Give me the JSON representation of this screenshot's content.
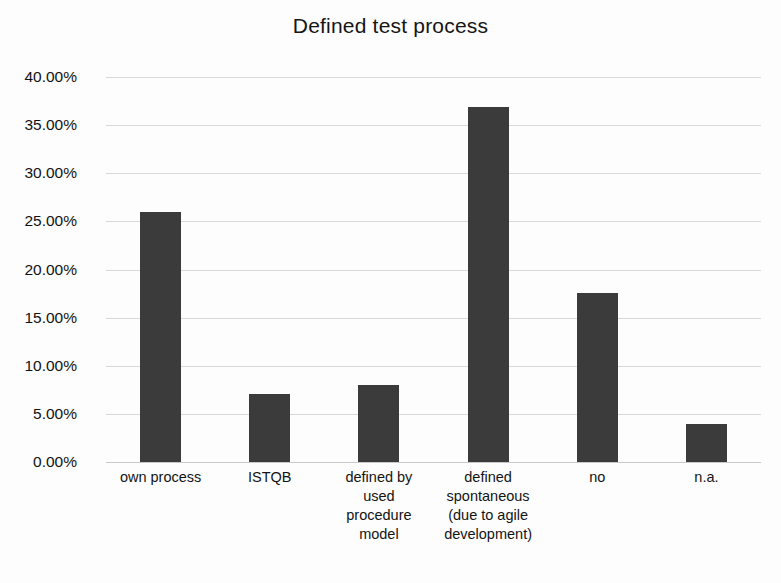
{
  "chart_data": {
    "type": "bar",
    "title": "Defined test process",
    "xlabel": "",
    "ylabel": "",
    "grid": true,
    "legend": "none",
    "ylim": [
      0,
      40
    ],
    "ytick_step": 5,
    "categories": [
      "own process",
      "ISTQB",
      "defined by used procedure model",
      "defined spontaneous (due to agile development)",
      "no",
      "n.a."
    ],
    "category_lines": [
      [
        "own process"
      ],
      [
        "ISTQB"
      ],
      [
        "defined by",
        "used",
        "procedure",
        "model"
      ],
      [
        "defined",
        "spontaneous",
        "(due to agile",
        "development)"
      ],
      [
        "no"
      ],
      [
        "n.a."
      ]
    ],
    "values": [
      26.0,
      7.1,
      8.0,
      36.9,
      17.6,
      3.9
    ],
    "value_labels": [
      "26.00%",
      "7.10%",
      "8.00%",
      "36.90%",
      "17.60%",
      "3.90%"
    ],
    "ytick_labels": [
      "40.00%",
      "35.00%",
      "30.00%",
      "25.00%",
      "20.00%",
      "15.00%",
      "10.00%",
      "5.00%",
      "0.00%"
    ],
    "ytick_values": [
      40,
      35,
      30,
      25,
      20,
      15,
      10,
      5,
      0
    ],
    "colors": {
      "bar": "#3b3b3b",
      "gridline": "#d8d8d8",
      "text": "#121212",
      "background": "#fdfdfd"
    }
  }
}
